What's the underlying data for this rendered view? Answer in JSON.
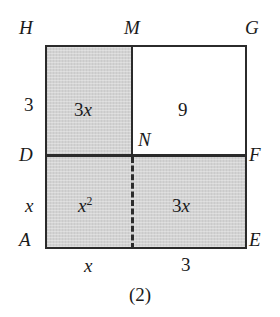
{
  "figure": {
    "caption": "(2)",
    "shade_color": "#d3d3d3",
    "line_color": "#2b2b2b",
    "background_color": "#ffffff"
  },
  "vertices": {
    "top_left": "H",
    "top_middle": "M",
    "top_right": "G",
    "middle_left": "D",
    "center": "N",
    "middle_right": "F",
    "bottom_left": "A",
    "bottom_right": "E"
  },
  "dimensions": {
    "left_upper": "3",
    "left_lower": "x",
    "bottom_left": "x",
    "bottom_right": "3"
  },
  "areas": {
    "top_left": {
      "coefficient": "3",
      "variable": "x",
      "exponent": ""
    },
    "top_right": {
      "coefficient": "9",
      "variable": "",
      "exponent": ""
    },
    "bottom_left": {
      "coefficient": "",
      "variable": "x",
      "exponent": "2"
    },
    "bottom_right": {
      "coefficient": "3",
      "variable": "x",
      "exponent": ""
    }
  }
}
